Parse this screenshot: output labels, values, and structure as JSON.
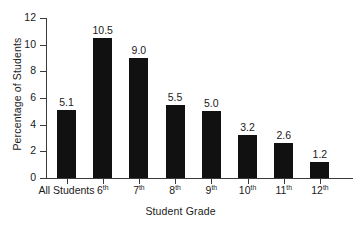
{
  "chart_data": {
    "type": "bar",
    "title": "",
    "subtitle": "",
    "xlabel": "Student Grade",
    "ylabel": "Percentage of Students",
    "categories": [
      "All Students",
      "6th",
      "7th",
      "8th",
      "9th",
      "10th",
      "11th",
      "12th"
    ],
    "category_superscripts": [
      "",
      "th",
      "th",
      "th",
      "th",
      "th",
      "th",
      "th"
    ],
    "category_bases": [
      "All Students",
      "6",
      "7",
      "8",
      "9",
      "10",
      "11",
      "12"
    ],
    "values": [
      5.1,
      10.5,
      9.0,
      5.5,
      5.0,
      3.2,
      2.6,
      1.2
    ],
    "value_labels": [
      "5.1",
      "10.5",
      "9.0",
      "5.5",
      "5.0",
      "3.2",
      "2.6",
      "1.2"
    ],
    "ylim": [
      0,
      12
    ],
    "yticks": [
      0,
      2,
      4,
      6,
      8,
      10,
      12
    ],
    "ytick_labels": [
      "0",
      "2",
      "4",
      "6",
      "8",
      "10",
      "12"
    ],
    "grid": false,
    "legend": false,
    "legend_position": "none",
    "bar_color": "#111111",
    "axis_color": "#3a3a3a",
    "text_color": "#1a1a1a",
    "background_color": "#ffffff"
  }
}
